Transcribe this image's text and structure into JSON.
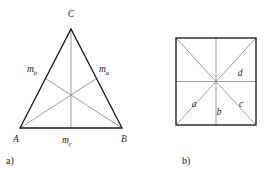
{
  "figure": {
    "background_color": "#ffffff",
    "outline_color": "#1a1a1a",
    "inner_line_color": "#8a8a8a",
    "text_color": "#1a1a1a",
    "panels": [
      {
        "id": "panel-a",
        "caption": "a)",
        "shape": "triangle",
        "description": "Triangle with three medians meeting at the centroid",
        "vertices": [
          {
            "name": "A",
            "label": "A",
            "x": 20,
            "y": 128
          },
          {
            "name": "B",
            "label": "B",
            "x": 122,
            "y": 128
          },
          {
            "name": "C",
            "label": "C",
            "x": 71,
            "y": 29
          }
        ],
        "midpoints": [
          {
            "name": "m_a",
            "label_base": "m",
            "label_sub": "a",
            "x": 96.5,
            "y": 78.5
          },
          {
            "name": "m_b",
            "label_base": "m",
            "label_sub": "b",
            "x": 45.5,
            "y": 78.5
          },
          {
            "name": "m_c",
            "label_base": "m",
            "label_sub": "c",
            "x": 71,
            "y": 128
          }
        ],
        "centroid": {
          "name": "centroid",
          "x": 71,
          "y": 95
        },
        "vertex_labels": [
          {
            "text": "C",
            "x": 71,
            "y": 17
          },
          {
            "text": "A",
            "x": 16,
            "y": 142
          },
          {
            "text": "B",
            "x": 124,
            "y": 142
          }
        ],
        "median_labels": [
          {
            "base": "m",
            "sub": "b",
            "x": 27,
            "y": 72
          },
          {
            "base": "m",
            "sub": "a",
            "x": 99,
            "y": 72
          },
          {
            "base": "m",
            "sub": "c",
            "x": 62,
            "y": 143
          }
        ],
        "caption_pos": {
          "x": 6,
          "y": 164
        }
      },
      {
        "id": "panel-b",
        "caption": "b)",
        "shape": "square",
        "description": "Square with both diagonals and the horizontal and vertical midlines",
        "bounds": {
          "left": 176,
          "top": 38,
          "right": 256,
          "bottom": 125
        },
        "center": {
          "x": 216,
          "y": 81.5
        },
        "region_labels": [
          {
            "text": "a",
            "x": 194,
            "y": 107
          },
          {
            "text": "b",
            "x": 219,
            "y": 115
          },
          {
            "text": "c",
            "x": 241,
            "y": 107
          },
          {
            "text": "d",
            "x": 240,
            "y": 76
          }
        ],
        "caption_pos": {
          "x": 182,
          "y": 164
        }
      }
    ]
  }
}
